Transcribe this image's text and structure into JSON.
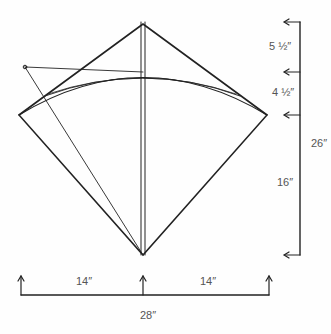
{
  "diagram": {
    "colors": {
      "line": "#222222",
      "text": "#555555",
      "background": "#fefefe"
    },
    "dimensions": {
      "top_segment": "5 ½″",
      "bow_segment": "4 ½″",
      "lower_segment": "16″",
      "total_height": "26″",
      "left_half_width": "14″",
      "right_half_width": "14″",
      "total_width": "28″"
    }
  }
}
